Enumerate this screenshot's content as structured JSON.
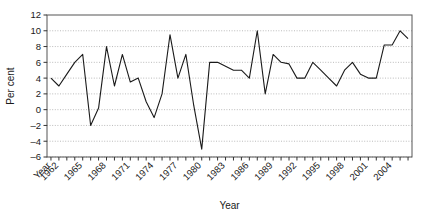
{
  "chart_data": {
    "type": "line",
    "title": "",
    "xlabel": "Year",
    "ylabel": "Per cent",
    "xlim": [
      1960.5,
      2006.5
    ],
    "ylim": [
      -6,
      12
    ],
    "ytick_values": [
      -6,
      -4,
      -2,
      0,
      2,
      4,
      6,
      8,
      10,
      12
    ],
    "ytick_labels": [
      "-6",
      "-4",
      "-2",
      "0",
      "2",
      "4",
      "6",
      "8",
      "10",
      "12"
    ],
    "xtick_values": [
      1961,
      1962,
      1965,
      1968,
      1971,
      1974,
      1977,
      1980,
      1983,
      1986,
      1989,
      1992,
      1995,
      1998,
      2001,
      2004
    ],
    "xtick_labels": [
      "Year",
      "1962",
      "1965",
      "1968",
      "1971",
      "1974",
      "1977",
      "1980",
      "1983",
      "1986",
      "1989",
      "1992",
      "1995",
      "1998",
      "2001",
      "2004"
    ],
    "grid": "horizontal-dotted",
    "legend": "none",
    "line_color": "#1a1a1a",
    "x": [
      1961,
      1962,
      1963,
      1964,
      1965,
      1966,
      1967,
      1968,
      1969,
      1970,
      1971,
      1972,
      1973,
      1974,
      1975,
      1976,
      1977,
      1978,
      1979,
      1980,
      1981,
      1982,
      1983,
      1984,
      1985,
      1986,
      1987,
      1988,
      1989,
      1990,
      1991,
      1992,
      1993,
      1994,
      1995,
      1996,
      1997,
      1998,
      1999,
      2000,
      2001,
      2002,
      2003,
      2004,
      2005,
      2006
    ],
    "values": [
      4,
      3,
      4.5,
      6,
      7,
      -2,
      0.2,
      8,
      3,
      7,
      3.5,
      4,
      1,
      -1,
      2,
      9.5,
      4,
      7,
      0.5,
      -5,
      6,
      6,
      5.5,
      5,
      5,
      4,
      10,
      2,
      7,
      6,
      5.8,
      4,
      4,
      6,
      5,
      4,
      3,
      5,
      6,
      4.5,
      4,
      4,
      8.2,
      8.2,
      10,
      9
    ],
    "series": [
      {
        "name": "Per cent",
        "values": [
          4,
          3,
          4.5,
          6,
          7,
          -2,
          0.2,
          8,
          3,
          7,
          3.5,
          4,
          1,
          -1,
          2,
          9.5,
          4,
          7,
          0.5,
          -5,
          6,
          6,
          5.5,
          5,
          5,
          4,
          10,
          2,
          7,
          6,
          5.8,
          4,
          4,
          6,
          5,
          4,
          3,
          5,
          6,
          4.5,
          4,
          4,
          8.2,
          8.2,
          10,
          9
        ]
      }
    ]
  }
}
